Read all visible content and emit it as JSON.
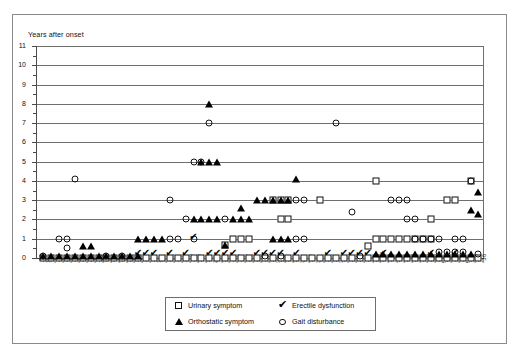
{
  "figure": {
    "y_axis_title": "Years after onset"
  },
  "legend": {
    "items": [
      {
        "label": "Urinary symptom",
        "symbol": "open-square",
        "color": "#000000"
      },
      {
        "label": "Erectile dysfunction",
        "symbol": "check-mark",
        "color": "#000000"
      },
      {
        "label": "Orthostatic symptom",
        "symbol": "filled-triangle",
        "color": "#000000"
      },
      {
        "label": "Gait disturbance",
        "symbol": "open-circle",
        "color": "#000000"
      }
    ]
  },
  "chart_data": {
    "type": "scatter",
    "title": "",
    "xlabel": "",
    "ylabel": "Years after onset",
    "ylim": [
      0,
      11
    ],
    "yticks": [
      0,
      1,
      2,
      3,
      4,
      5,
      6,
      7,
      8,
      9,
      10,
      11
    ],
    "grid": "horizontal",
    "legend_position": "bottom-center",
    "x_tick_labels": [
      "1",
      "*2",
      "*3",
      "*4",
      "*5",
      "*6",
      "*7",
      "*8",
      "*9",
      "*10",
      "*11",
      "*12",
      "*13",
      "*14",
      "15",
      "*16",
      "*17",
      "*18",
      "*19",
      "*20",
      "*21",
      "22",
      "*23",
      "*24",
      "*25",
      "*26",
      "*27",
      "*28",
      "*29",
      "30",
      "*31",
      "*32",
      "33",
      "*34",
      "35",
      "*36",
      "*37",
      "38",
      "*39",
      "*40",
      "*41",
      "42",
      "*43",
      "*44",
      "45",
      "*46",
      "*47",
      "48",
      "*49",
      "*50",
      "51",
      "*52",
      "*53",
      "54",
      "*55",
      "*56"
    ],
    "x_categories": [
      1,
      2,
      3,
      4,
      5,
      6,
      7,
      8,
      9,
      10,
      11,
      12,
      13,
      14,
      15,
      16,
      17,
      18,
      19,
      20,
      21,
      22,
      23,
      24,
      25,
      26,
      27,
      28,
      29,
      30,
      31,
      32,
      33,
      34,
      35,
      36,
      37,
      38,
      39,
      40,
      41,
      42,
      43,
      44,
      45,
      46,
      47,
      48,
      49,
      50,
      51,
      52,
      53,
      54,
      55,
      56
    ],
    "series": [
      {
        "name": "Urinary symptom",
        "symbol": "open-square",
        "points": [
          [
            1,
            0
          ],
          [
            2,
            0
          ],
          [
            3,
            0
          ],
          [
            4,
            0
          ],
          [
            5,
            0
          ],
          [
            6,
            0
          ],
          [
            7,
            0
          ],
          [
            8,
            0
          ],
          [
            9,
            0
          ],
          [
            10,
            0
          ],
          [
            11,
            0
          ],
          [
            12,
            0
          ],
          [
            13,
            0
          ],
          [
            14,
            0
          ],
          [
            15,
            0
          ],
          [
            16,
            0
          ],
          [
            17,
            0
          ],
          [
            18,
            0
          ],
          [
            19,
            0
          ],
          [
            20,
            0
          ],
          [
            21,
            0
          ],
          [
            22,
            0
          ],
          [
            23,
            0
          ],
          [
            24,
            0
          ],
          [
            25,
            0
          ],
          [
            26,
            0
          ],
          [
            27,
            0
          ],
          [
            28,
            0
          ],
          [
            29,
            0
          ],
          [
            30,
            0
          ],
          [
            31,
            0
          ],
          [
            32,
            0
          ],
          [
            33,
            0
          ],
          [
            34,
            0
          ],
          [
            35,
            0
          ],
          [
            36,
            0
          ],
          [
            37,
            0
          ],
          [
            38,
            0
          ],
          [
            39,
            0
          ],
          [
            40,
            0
          ],
          [
            41,
            0
          ],
          [
            42,
            0
          ],
          [
            43,
            0
          ],
          [
            44,
            0
          ],
          [
            45,
            0
          ],
          [
            46,
            0
          ],
          [
            47,
            0
          ],
          [
            48,
            0
          ],
          [
            49,
            0
          ],
          [
            50,
            0
          ],
          [
            51,
            0
          ],
          [
            52,
            0
          ],
          [
            53,
            0
          ],
          [
            54,
            0
          ],
          [
            55,
            0
          ],
          [
            56,
            0
          ],
          [
            24,
            0.7
          ],
          [
            42,
            0.6
          ],
          [
            25,
            1
          ],
          [
            26,
            1
          ],
          [
            27,
            1
          ],
          [
            43,
            1
          ],
          [
            44,
            1
          ],
          [
            45,
            1
          ],
          [
            46,
            1
          ],
          [
            47,
            1
          ],
          [
            48,
            1
          ],
          [
            49,
            1
          ],
          [
            50,
            1
          ],
          [
            31,
            2
          ],
          [
            32,
            2
          ],
          [
            50,
            2
          ],
          [
            30,
            3
          ],
          [
            31,
            3
          ],
          [
            32,
            3
          ],
          [
            36,
            3
          ],
          [
            52,
            3
          ],
          [
            53,
            3
          ],
          [
            43,
            4
          ],
          [
            55,
            4
          ]
        ]
      },
      {
        "name": "Orthostatic symptom",
        "symbol": "filled-triangle",
        "points": [
          [
            1,
            0.1
          ],
          [
            2,
            0.1
          ],
          [
            3,
            0.1
          ],
          [
            4,
            0.1
          ],
          [
            5,
            0.1
          ],
          [
            6,
            0.1
          ],
          [
            7,
            0.1
          ],
          [
            8,
            0.1
          ],
          [
            9,
            0.1
          ],
          [
            10,
            0.1
          ],
          [
            11,
            0.1
          ],
          [
            12,
            0.1
          ],
          [
            13,
            0.1
          ],
          [
            43,
            0.2
          ],
          [
            44,
            0.2
          ],
          [
            45,
            0.2
          ],
          [
            46,
            0.2
          ],
          [
            47,
            0.2
          ],
          [
            48,
            0.2
          ],
          [
            49,
            0.2
          ],
          [
            50,
            0.2
          ],
          [
            51,
            0.2
          ],
          [
            52,
            0.2
          ],
          [
            53,
            0.2
          ],
          [
            54,
            0.2
          ],
          [
            55,
            0.2
          ],
          [
            6,
            0.6
          ],
          [
            7,
            0.6
          ],
          [
            24,
            0.7
          ],
          [
            13,
            1
          ],
          [
            14,
            1
          ],
          [
            15,
            1
          ],
          [
            16,
            1
          ],
          [
            30,
            1
          ],
          [
            31,
            1
          ],
          [
            32,
            1
          ],
          [
            20,
            2
          ],
          [
            21,
            2
          ],
          [
            22,
            2
          ],
          [
            23,
            2
          ],
          [
            25,
            2
          ],
          [
            26,
            2
          ],
          [
            27,
            2
          ],
          [
            56,
            2.3
          ],
          [
            26,
            2.6
          ],
          [
            55,
            2.5
          ],
          [
            28,
            3
          ],
          [
            29,
            3
          ],
          [
            30,
            3
          ],
          [
            31,
            3
          ],
          [
            32,
            3
          ],
          [
            56,
            3.4
          ],
          [
            33,
            4.1
          ],
          [
            21,
            5
          ],
          [
            22,
            5
          ],
          [
            23,
            5
          ],
          [
            22,
            8
          ]
        ]
      },
      {
        "name": "Gait disturbance",
        "symbol": "open-circle",
        "points": [
          [
            1,
            0.1
          ],
          [
            9,
            0.1
          ],
          [
            11,
            0.1
          ],
          [
            29,
            0.1
          ],
          [
            31,
            0.1
          ],
          [
            41,
            0.1
          ],
          [
            56,
            0.2
          ],
          [
            51,
            0.3
          ],
          [
            52,
            0.3
          ],
          [
            53,
            0.3
          ],
          [
            54,
            0.3
          ],
          [
            4,
            0.5
          ],
          [
            3,
            1
          ],
          [
            4,
            1
          ],
          [
            17,
            1
          ],
          [
            18,
            1
          ],
          [
            20,
            1
          ],
          [
            33,
            1
          ],
          [
            34,
            1
          ],
          [
            48,
            1
          ],
          [
            49,
            1
          ],
          [
            50,
            1
          ],
          [
            51,
            1
          ],
          [
            53,
            1
          ],
          [
            54,
            1
          ],
          [
            19,
            2
          ],
          [
            24,
            2
          ],
          [
            47,
            2
          ],
          [
            48,
            2
          ],
          [
            40,
            2.4
          ],
          [
            17,
            3
          ],
          [
            33,
            3
          ],
          [
            34,
            3
          ],
          [
            45,
            3
          ],
          [
            46,
            3
          ],
          [
            47,
            3
          ],
          [
            5,
            4.1
          ],
          [
            20,
            5
          ],
          [
            21,
            5
          ],
          [
            22,
            7
          ],
          [
            38,
            7
          ],
          [
            55,
            4
          ]
        ]
      },
      {
        "name": "Erectile dysfunction",
        "symbol": "check-mark",
        "points": [
          [
            13,
            0.25
          ],
          [
            14,
            0.25
          ],
          [
            15,
            0.25
          ],
          [
            17,
            0.25
          ],
          [
            19,
            0.25
          ],
          [
            22,
            0.25
          ],
          [
            23,
            0.25
          ],
          [
            24,
            0.25
          ],
          [
            25,
            0.25
          ],
          [
            28,
            0.25
          ],
          [
            29,
            0.25
          ],
          [
            30,
            0.25
          ],
          [
            31,
            0.25
          ],
          [
            33,
            0.25
          ],
          [
            37,
            0.25
          ],
          [
            39,
            0.25
          ],
          [
            40,
            0.25
          ],
          [
            41,
            0.25
          ],
          [
            42,
            0.25
          ],
          [
            44,
            0.25
          ],
          [
            50,
            0.25
          ],
          [
            53,
            0.25
          ],
          [
            20,
            1.1
          ]
        ]
      }
    ]
  }
}
